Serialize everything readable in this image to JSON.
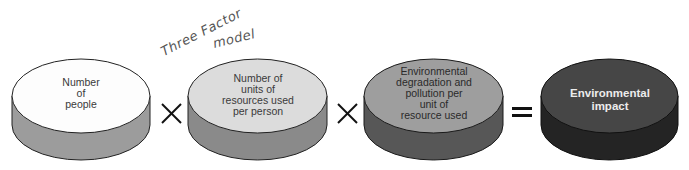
{
  "annotation": {
    "line1": "Three Factor",
    "line2": "model"
  },
  "discs": [
    {
      "label": "Number\nof\npeople",
      "top_color": "#fdfdfd",
      "side_color": "#9c9c9c",
      "text_color": "#3a3a3a",
      "bold": false
    },
    {
      "label": "Number of\nunits of\nresources used\nper person",
      "top_color": "#dcdcdc",
      "side_color": "#8a8a8a",
      "text_color": "#3a3a3a",
      "bold": false
    },
    {
      "label": "Environmental\ndegradation and\npollution per\nunit of\nresource used",
      "top_color": "#9e9e9e",
      "side_color": "#575757",
      "text_color": "#2a2a2a",
      "bold": false
    },
    {
      "label": "Environmental\nimpact",
      "top_color": "#464646",
      "side_color": "#242424",
      "text_color": "#ececec",
      "bold": true
    }
  ],
  "operators": [
    "multiply",
    "multiply",
    "equals"
  ]
}
